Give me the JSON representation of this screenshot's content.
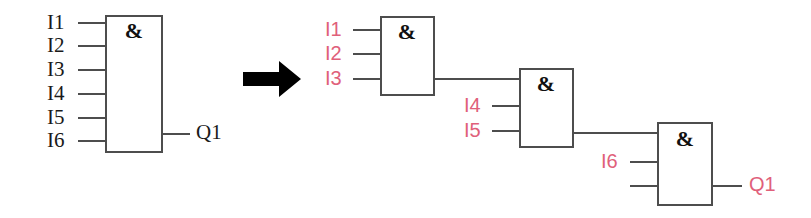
{
  "diagram": {
    "background_color": "#ffffff",
    "wire_color": "#4d4d4d",
    "dark_label_color": "#1a1a1a",
    "pink_label_color": "#e0607a",
    "arrow_color": "#000000",
    "gate_symbol": "&",
    "arrow": {
      "name": "transform-arrow",
      "direction": "right"
    },
    "left_side": {
      "gate": {
        "symbol": "&",
        "inputs": [
          "I1",
          "I2",
          "I3",
          "I4",
          "I5",
          "I6"
        ],
        "output": "Q1"
      }
    },
    "right_side": {
      "gates": [
        {
          "symbol": "&",
          "inputs": [
            "I1",
            "I2",
            "I3"
          ],
          "output": ""
        },
        {
          "symbol": "&",
          "inputs": [
            "",
            "I4",
            "I5"
          ],
          "output": ""
        },
        {
          "symbol": "&",
          "inputs": [
            "",
            "I6",
            ""
          ],
          "output": "Q1"
        }
      ]
    }
  }
}
